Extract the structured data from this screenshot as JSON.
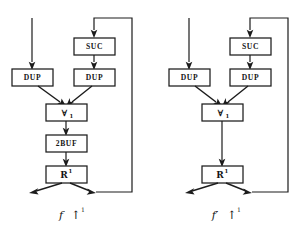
{
  "figure": {
    "name": "dataflow-network-pair",
    "background_color": "#ffffff",
    "ink_color": "#1c1c1c",
    "diagrams": [
      {
        "id": "left",
        "caption": {
          "symbol": "f",
          "operator": "↑",
          "superscript": "1"
        },
        "nodes": [
          {
            "id": "suc",
            "label": "SUC",
            "kind": "text"
          },
          {
            "id": "dup_l",
            "label": "DUP",
            "kind": "text"
          },
          {
            "id": "dup_r",
            "label": "DUP",
            "kind": "text"
          },
          {
            "id": "forall",
            "label": "∀",
            "subscript": "1",
            "kind": "symbol"
          },
          {
            "id": "twobuf",
            "label": "2BUF",
            "kind": "text"
          },
          {
            "id": "rbox",
            "label": "R",
            "superscript": "1",
            "kind": "symbol"
          }
        ],
        "edges": [
          {
            "from": "external-input",
            "to": "dup_l"
          },
          {
            "from": "feedback-loop",
            "to": "suc"
          },
          {
            "from": "suc",
            "to": "dup_r"
          },
          {
            "from": "dup_l",
            "to": "forall"
          },
          {
            "from": "dup_r",
            "to": "forall"
          },
          {
            "from": "forall",
            "to": "twobuf"
          },
          {
            "from": "twobuf",
            "to": "rbox"
          },
          {
            "from": "rbox",
            "to": "external-output"
          },
          {
            "from": "rbox",
            "to": "feedback-loop"
          }
        ]
      },
      {
        "id": "right",
        "caption": {
          "symbol": "f′",
          "operator": "↑",
          "superscript": "1"
        },
        "nodes": [
          {
            "id": "suc",
            "label": "SUC",
            "kind": "text"
          },
          {
            "id": "dup_l",
            "label": "DUP",
            "kind": "text"
          },
          {
            "id": "dup_r",
            "label": "DUP",
            "kind": "text"
          },
          {
            "id": "forall",
            "label": "∀",
            "subscript": "1",
            "kind": "symbol"
          },
          {
            "id": "rbox",
            "label": "R",
            "superscript": "1",
            "kind": "symbol"
          }
        ],
        "edges": [
          {
            "from": "external-input",
            "to": "dup_l"
          },
          {
            "from": "feedback-loop",
            "to": "suc"
          },
          {
            "from": "suc",
            "to": "dup_r"
          },
          {
            "from": "dup_l",
            "to": "forall"
          },
          {
            "from": "dup_r",
            "to": "forall"
          },
          {
            "from": "forall",
            "to": "rbox"
          },
          {
            "from": "rbox",
            "to": "external-output"
          },
          {
            "from": "rbox",
            "to": "feedback-loop"
          }
        ]
      }
    ]
  }
}
